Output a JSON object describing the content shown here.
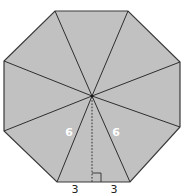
{
  "figure": {
    "shape": "regular octagon",
    "colors": {
      "fill": "#c1c1c1",
      "stroke": "#2e2e2e",
      "side_label_color": "#ffffff",
      "base_label_color": "#222222"
    },
    "labels": {
      "left_slant": "6",
      "right_slant": "6",
      "base_left_half": "3",
      "base_right_half": "3"
    },
    "triangle_count": 8,
    "has_right_angle_marker": true,
    "apothem_style": "dashed"
  }
}
